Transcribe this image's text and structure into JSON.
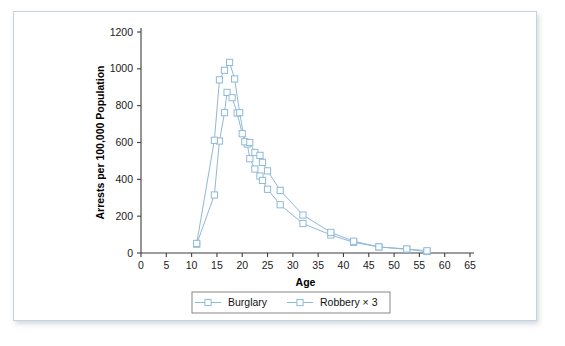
{
  "figure": {
    "background_color": "#ffffff",
    "frame_color": "#c3d3e2"
  },
  "chart_data": {
    "type": "line",
    "title": "",
    "xlabel": "Age",
    "ylabel": "Arrests per 100,000 Population",
    "xlim": [
      0,
      65
    ],
    "ylim": [
      0,
      1200
    ],
    "xticks": [
      0,
      5,
      10,
      15,
      20,
      25,
      30,
      35,
      40,
      45,
      50,
      55,
      60,
      65
    ],
    "yticks": [
      0,
      200,
      400,
      600,
      800,
      1000,
      1200
    ],
    "xtick_labels": [
      "0",
      "5",
      "10",
      "15",
      "20",
      "25",
      "30",
      "35",
      "40",
      "45",
      "50",
      "55",
      "60",
      "65"
    ],
    "ytick_labels": [
      "0",
      "200",
      "400",
      "600",
      "800",
      "1000",
      "1200"
    ],
    "grid": false,
    "legend_position": "below-plot",
    "marker": "open-square",
    "series": [
      {
        "name": "Burglary",
        "color": "#8fb9d9",
        "points": [
          {
            "x": 11,
            "y": 48
          },
          {
            "x": 14.5,
            "y": 315
          },
          {
            "x": 15.5,
            "y": 608
          },
          {
            "x": 16.5,
            "y": 762
          },
          {
            "x": 17,
            "y": 872
          },
          {
            "x": 18,
            "y": 843
          },
          {
            "x": 19,
            "y": 760
          },
          {
            "x": 20,
            "y": 648
          },
          {
            "x": 21,
            "y": 592
          },
          {
            "x": 21.5,
            "y": 512
          },
          {
            "x": 22.5,
            "y": 456
          },
          {
            "x": 23.5,
            "y": 418
          },
          {
            "x": 24,
            "y": 394
          },
          {
            "x": 25,
            "y": 346
          },
          {
            "x": 27.5,
            "y": 262
          },
          {
            "x": 32,
            "y": 160
          },
          {
            "x": 37.5,
            "y": 98
          },
          {
            "x": 42,
            "y": 58
          },
          {
            "x": 47,
            "y": 33
          },
          {
            "x": 52.5,
            "y": 20
          },
          {
            "x": 56.5,
            "y": 8
          }
        ]
      },
      {
        "name": "Robbery × 3",
        "color": "#8fb9d9",
        "points": [
          {
            "x": 11,
            "y": 52
          },
          {
            "x": 14.5,
            "y": 612
          },
          {
            "x": 15.5,
            "y": 940
          },
          {
            "x": 16.5,
            "y": 992
          },
          {
            "x": 17.5,
            "y": 1035
          },
          {
            "x": 18.5,
            "y": 945
          },
          {
            "x": 19.5,
            "y": 762
          },
          {
            "x": 20.5,
            "y": 604
          },
          {
            "x": 21.5,
            "y": 600
          },
          {
            "x": 22.5,
            "y": 546
          },
          {
            "x": 23.5,
            "y": 530
          },
          {
            "x": 24,
            "y": 492
          },
          {
            "x": 25,
            "y": 446
          },
          {
            "x": 27.5,
            "y": 340
          },
          {
            "x": 32,
            "y": 206
          },
          {
            "x": 37.5,
            "y": 112
          },
          {
            "x": 42,
            "y": 64
          },
          {
            "x": 47,
            "y": 33
          },
          {
            "x": 52.5,
            "y": 22
          },
          {
            "x": 56.5,
            "y": 12
          }
        ]
      }
    ],
    "legend": [
      {
        "label": "Burglary",
        "color": "#8fb9d9"
      },
      {
        "label": "Robbery × 3",
        "color": "#8fb9d9"
      }
    ]
  }
}
